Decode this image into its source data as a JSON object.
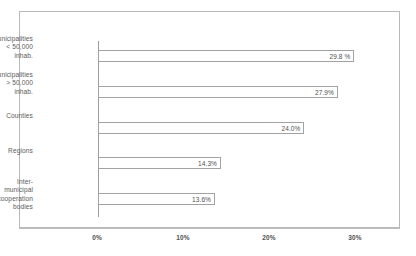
{
  "chart_data": {
    "type": "bar",
    "orientation": "horizontal",
    "title": "",
    "subtitle": "",
    "xlabel": "",
    "ylabel": "",
    "categories": [
      "Municipalities\n< 50,000 inhab.",
      "Municipalities\n> 50,000 inhab.",
      "Counties",
      "Regions",
      "Inter-municipal\ncooperation bodies"
    ],
    "values": [
      29.8,
      27.9,
      24.0,
      14.3,
      13.6
    ],
    "data_labels": [
      "29.8 %",
      "27.9%",
      "24.0%",
      "14.3%",
      "13.6%"
    ],
    "xlim": [
      0,
      30
    ],
    "xticks": [
      0,
      10,
      20,
      30
    ],
    "xtick_labels": [
      "0%",
      "10%",
      "20%",
      "30%"
    ],
    "grid": false,
    "legend": null,
    "bar_style": {
      "fill": "#ffffff",
      "border": "#a2a2a2"
    },
    "frame_color": "#b9b9b9",
    "axis_color": "#9d9d9d",
    "text_color": "#4f4f4f"
  },
  "bars": [
    {
      "label": "Municipalities\n< 50,000 inhab.",
      "value_label": "29.8 %",
      "value": 29.8
    },
    {
      "label": "Municipalities\n> 50,000 inhab.",
      "value_label": "27.9%",
      "value": 27.9
    },
    {
      "label": "Counties",
      "value_label": "24.0%",
      "value": 24.0
    },
    {
      "label": "Regions",
      "value_label": "14.3%",
      "value": 14.3
    },
    {
      "label": "Inter-municipal\ncooperation bodies",
      "value_label": "13.6%",
      "value": 13.6
    }
  ],
  "xaxis": {
    "ticks": [
      {
        "label": "0%"
      },
      {
        "label": "10%"
      },
      {
        "label": "20%"
      },
      {
        "label": "30%"
      }
    ]
  }
}
